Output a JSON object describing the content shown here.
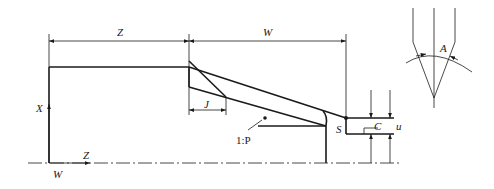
{
  "diagram": {
    "labels": {
      "z_dim": "Z",
      "w_dim": "W",
      "x_axis": "X",
      "z_axis": "Z",
      "origin_w": "W",
      "j_dim": "J",
      "taper": "1:P",
      "start_point": "S",
      "c_dim": "C",
      "u_dim": "u",
      "tool_angle": "A"
    },
    "colors": {
      "line": "#1a1a1a",
      "background": "#ffffff"
    }
  }
}
